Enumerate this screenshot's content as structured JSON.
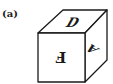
{
  "figure": {
    "label": "(a)",
    "type": "cube",
    "faces": {
      "top": {
        "letter": "D",
        "orientation": "italic, upright"
      },
      "front": {
        "letter": "F",
        "orientation": "rotated 180° (upside down)"
      },
      "right": {
        "letter": "A",
        "orientation": "rotated/skewed sideways"
      }
    },
    "stroke_color": "#1a1a1a",
    "fill_color": "#ffffff"
  }
}
